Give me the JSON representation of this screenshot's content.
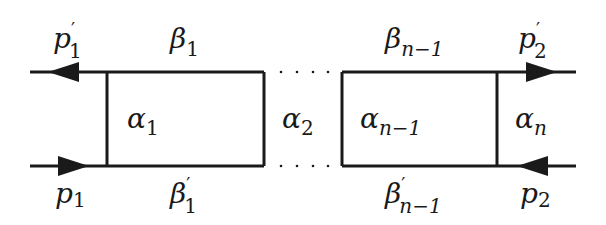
{
  "diagram": {
    "type": "ladder-diagram",
    "colors": {
      "line": "#1a1a1a",
      "background": "#ffffff"
    },
    "labels": {
      "p1_prime": {
        "base": "p",
        "sup": "′",
        "sub": "1"
      },
      "p1": {
        "base": "p",
        "sub": "1"
      },
      "p2_prime": {
        "base": "p",
        "sup": "′",
        "sub": "2"
      },
      "p2": {
        "base": "p",
        "sub": "2"
      },
      "beta_1": {
        "base": "β",
        "sub": "1"
      },
      "beta_1_prime": {
        "base": "β",
        "sup": "′",
        "sub": "1"
      },
      "beta_n_minus_1": {
        "base": "β",
        "sub": "n−1"
      },
      "beta_n_minus_1_prime": {
        "base": "β",
        "sup": "′",
        "sub": "n−1"
      },
      "alpha_1": {
        "base": "α",
        "sub": "1"
      },
      "alpha_2": {
        "base": "α",
        "sub": "2"
      },
      "alpha_n_minus_1": {
        "base": "α",
        "sub": "n−1"
      },
      "alpha_n": {
        "base": "α",
        "sub": "n"
      }
    },
    "ellipsis": "· · · ·"
  }
}
